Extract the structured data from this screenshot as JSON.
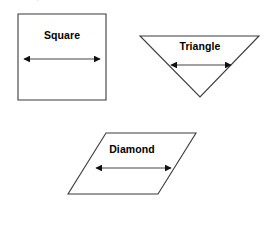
{
  "page": {
    "background_color": "#ffffff",
    "width": 270,
    "height": 247,
    "cropped_top_text": "."
  },
  "figure": {
    "stroke_color": "#3a3a3a",
    "arrow_color": "#111111",
    "label_color": "#000000",
    "shapes": [
      {
        "id": "square",
        "label": "Square",
        "kind": "square",
        "outline_points": "18,14 106,14 106,100 18,100",
        "arrow": {
          "x1": 24,
          "x2": 100,
          "y": 59
        }
      },
      {
        "id": "triangle",
        "label": "Triangle",
        "kind": "triangle-down",
        "outline_points": "140,36 259,36 200,97",
        "arrow": {
          "x1": 171,
          "x2": 231,
          "y": 65
        }
      },
      {
        "id": "diamond",
        "label": "Diamond",
        "kind": "parallelogram",
        "outline_points": "106,133 196,133 158,194 68,194",
        "arrow": {
          "x1": 96,
          "x2": 171,
          "y": 168
        }
      }
    ]
  }
}
